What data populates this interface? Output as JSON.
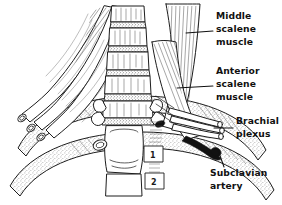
{
  "figure": {
    "background_color": "#ffffff",
    "ink_color": "#111111",
    "style": "black and white anatomical line drawing with stipple and hatch shading"
  },
  "labels": [
    {
      "id": "middle-scalene",
      "lines": [
        "Middle",
        "scalene",
        "muscle"
      ],
      "x": 216,
      "y": 19,
      "leader": {
        "x1": 213,
        "y1": 31,
        "x2": 186,
        "y2": 33
      }
    },
    {
      "id": "anterior-scalene",
      "lines": [
        "Anterior",
        "scalene",
        "muscle"
      ],
      "x": 216,
      "y": 74,
      "leader": {
        "x1": 213,
        "y1": 86,
        "x2": 177,
        "y2": 88
      }
    },
    {
      "id": "brachial-plexus",
      "lines": [
        "Brachial",
        "plexus"
      ],
      "x": 236,
      "y": 124,
      "leader": {
        "x1": 233,
        "y1": 128,
        "x2": 215,
        "y2": 128
      }
    },
    {
      "id": "subclavian-artery",
      "lines": [
        "Subclavian",
        "artery"
      ],
      "x": 210,
      "y": 176,
      "leader": {
        "x1": 224,
        "y1": 167,
        "x2": 218,
        "y2": 150
      }
    }
  ],
  "rib_numbers": [
    {
      "label": "1",
      "x": 150,
      "y": 155
    },
    {
      "label": "2",
      "x": 151,
      "y": 182
    }
  ],
  "structures": [
    {
      "name": "cervical-vertebral-column",
      "description": "stacked cervical vertebral bodies with stippled intervertebral discs"
    },
    {
      "name": "middle-scalene-muscle",
      "description": "striated muscle belly right of spine"
    },
    {
      "name": "anterior-scalene-muscle",
      "description": "striated muscle belly anterior to plexus"
    },
    {
      "name": "left-scalene-muscles-cut",
      "description": "cut tubular muscle stumps on left"
    },
    {
      "name": "brachial-plexus",
      "description": "nerve trunks passing between scalenes"
    },
    {
      "name": "subclavian-artery",
      "description": "dark filled vessel below plexus"
    },
    {
      "name": "first-rib",
      "description": "upper rib arc"
    },
    {
      "name": "second-rib",
      "description": "lower rib arc"
    }
  ]
}
